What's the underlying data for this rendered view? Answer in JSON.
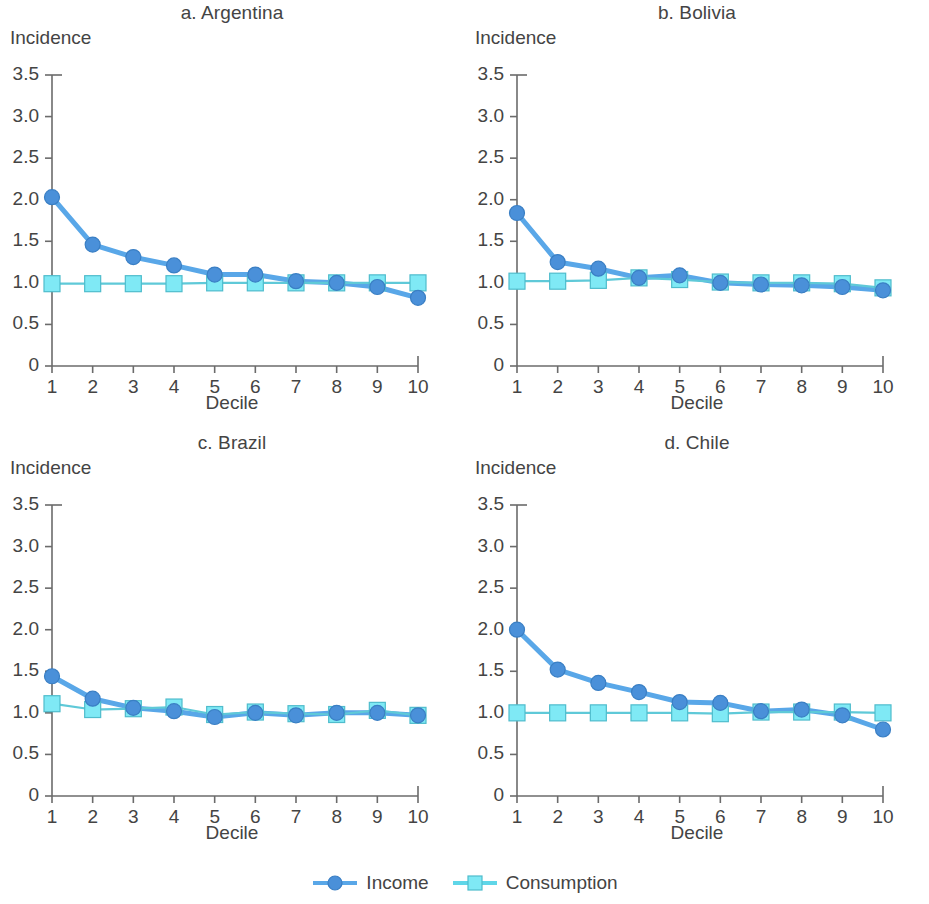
{
  "figure": {
    "y_axis_title": "Incidence",
    "x_axis_title": "Decile"
  },
  "legend": {
    "position": "bottom-center",
    "entries": [
      {
        "label": "Income",
        "marker": "circle",
        "color": "#4a90d9",
        "line_color": "#59a7e8"
      },
      {
        "label": "Consumption",
        "marker": "square",
        "color": "#7fe9f5",
        "line_color": "#5fd6e8"
      }
    ]
  },
  "colors": {
    "income": "#4a90d9",
    "income_line": "#59a7e8",
    "consumption_fill": "#7fe9f5",
    "consumption_edge": "#5fc9d8",
    "axis": "#6b6b6b",
    "text": "#444444",
    "background": "#ffffff"
  },
  "axis": {
    "y_ticks": [
      "0",
      "0.5",
      "1.0",
      "1.5",
      "2.0",
      "2.5",
      "3.0",
      "3.5"
    ],
    "y_tick_values": [
      0,
      0.5,
      1.0,
      1.5,
      2.0,
      2.5,
      3.0,
      3.5
    ],
    "x_ticks": [
      "1",
      "2",
      "3",
      "4",
      "5",
      "6",
      "7",
      "8",
      "9",
      "10"
    ],
    "x_tick_values": [
      1,
      2,
      3,
      4,
      5,
      6,
      7,
      8,
      9,
      10
    ],
    "ylim": [
      0,
      3.5
    ],
    "xlim": [
      1,
      10
    ],
    "grid": false
  },
  "chart_data": [
    {
      "type": "line",
      "title": "a. Argentina",
      "xlabel": "Decile",
      "ylabel": "Incidence",
      "categories": [
        1,
        2,
        3,
        4,
        5,
        6,
        7,
        8,
        9,
        10
      ],
      "ylim": [
        0,
        3.5
      ],
      "xlim": [
        1,
        10
      ],
      "grid": false,
      "series": [
        {
          "name": "Income",
          "values": [
            2.03,
            1.46,
            1.31,
            1.21,
            1.1,
            1.1,
            1.02,
            1.0,
            0.95,
            0.82
          ]
        },
        {
          "name": "Consumption",
          "values": [
            0.99,
            0.99,
            0.99,
            0.99,
            1.0,
            1.0,
            1.0,
            1.0,
            1.0,
            1.0
          ]
        }
      ]
    },
    {
      "type": "line",
      "title": "b. Bolivia",
      "xlabel": "Decile",
      "ylabel": "Incidence",
      "categories": [
        1,
        2,
        3,
        4,
        5,
        6,
        7,
        8,
        9,
        10
      ],
      "ylim": [
        0,
        3.5
      ],
      "xlim": [
        1,
        10
      ],
      "grid": false,
      "series": [
        {
          "name": "Income",
          "values": [
            1.84,
            1.25,
            1.17,
            1.06,
            1.09,
            1.0,
            0.98,
            0.97,
            0.95,
            0.91
          ]
        },
        {
          "name": "Consumption",
          "values": [
            1.02,
            1.02,
            1.03,
            1.06,
            1.04,
            1.01,
            1.0,
            1.0,
            0.99,
            0.94
          ]
        }
      ]
    },
    {
      "type": "line",
      "title": "c. Brazil",
      "xlabel": "Decile",
      "ylabel": "Incidence",
      "categories": [
        1,
        2,
        3,
        4,
        5,
        6,
        7,
        8,
        9,
        10
      ],
      "ylim": [
        0,
        3.5
      ],
      "xlim": [
        1,
        10
      ],
      "grid": false,
      "series": [
        {
          "name": "Income",
          "values": [
            1.44,
            1.17,
            1.06,
            1.02,
            0.95,
            1.0,
            0.97,
            1.0,
            1.0,
            0.97
          ]
        },
        {
          "name": "Consumption",
          "values": [
            1.11,
            1.04,
            1.05,
            1.07,
            0.98,
            1.01,
            0.99,
            0.98,
            1.03,
            0.97
          ]
        }
      ]
    },
    {
      "type": "line",
      "title": "d. Chile",
      "xlabel": "Decile",
      "ylabel": "Incidence",
      "categories": [
        1,
        2,
        3,
        4,
        5,
        6,
        7,
        8,
        9,
        10
      ],
      "ylim": [
        0,
        3.5
      ],
      "xlim": [
        1,
        10
      ],
      "grid": false,
      "series": [
        {
          "name": "Income",
          "values": [
            2.0,
            1.52,
            1.36,
            1.25,
            1.13,
            1.12,
            1.02,
            1.04,
            0.97,
            0.8
          ]
        },
        {
          "name": "Consumption",
          "values": [
            1.0,
            1.0,
            1.0,
            1.0,
            1.0,
            0.99,
            1.01,
            1.01,
            1.01,
            1.0
          ]
        }
      ]
    }
  ]
}
